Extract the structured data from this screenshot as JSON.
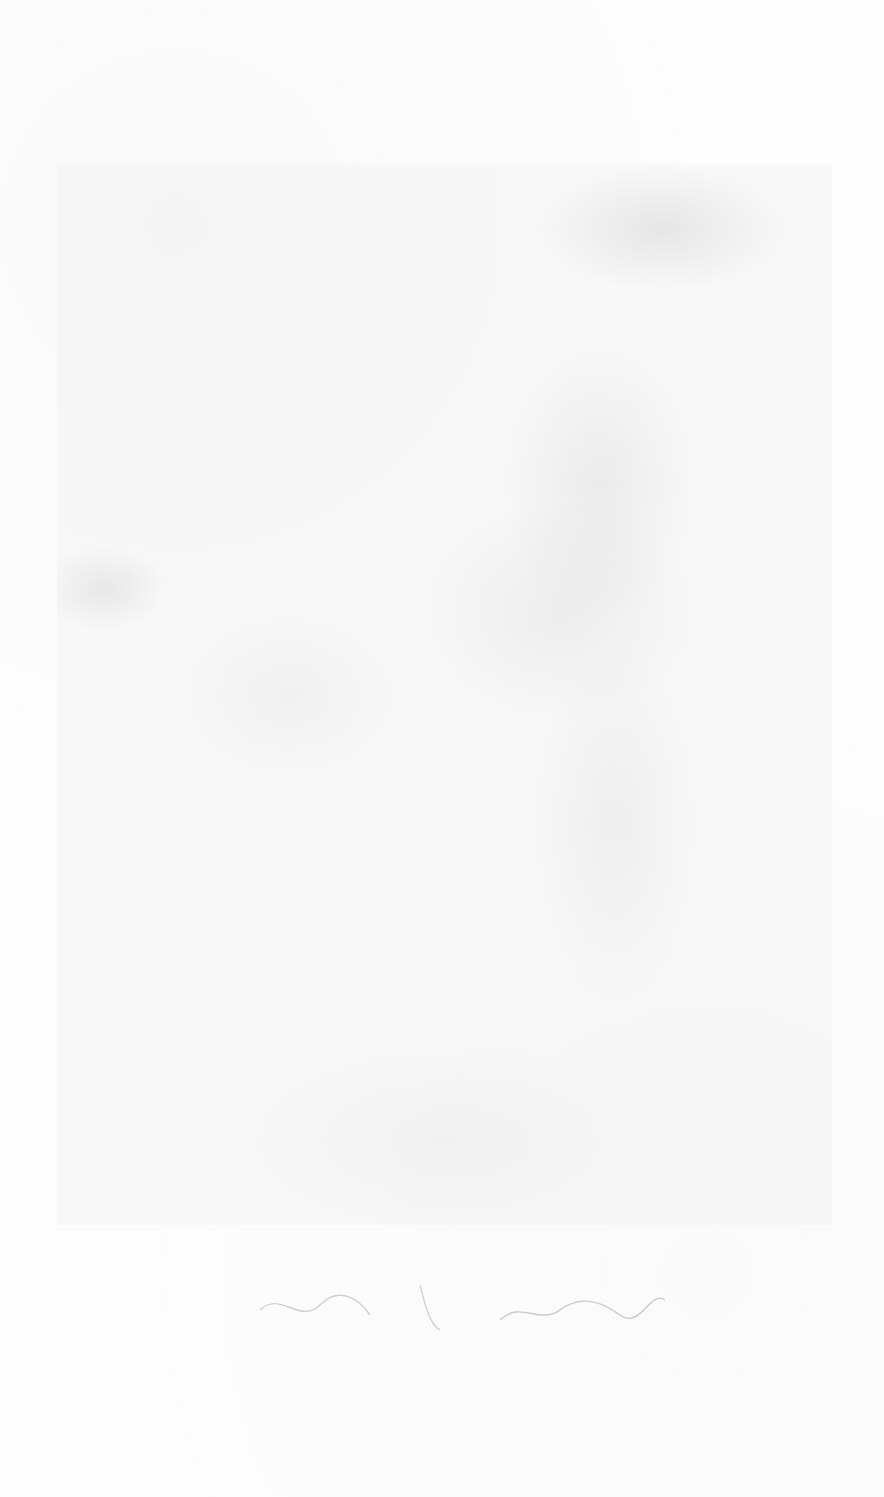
{
  "image": {
    "description": "Faint scanned print on paper: mottled gray plate area with a faint handwritten signature below",
    "plate_tone": "#e8e8e8",
    "paper_color": "#fdfdfd",
    "signature": ""
  }
}
